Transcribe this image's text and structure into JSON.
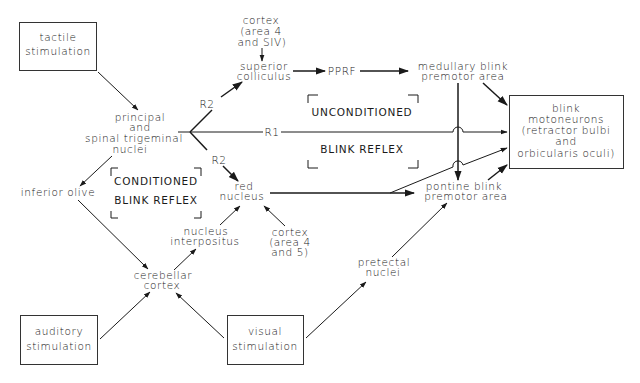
{
  "diagram": {
    "boxes": {
      "tactile": [
        "tactile",
        "stimulation"
      ],
      "auditory": [
        "auditory",
        "stimulation"
      ],
      "visual": [
        "visual",
        "stimulation"
      ],
      "motoneurons": [
        "blink",
        "motoneurons",
        "(retractor bulbi",
        "and",
        "orbicularis oculi)"
      ]
    },
    "nodes": {
      "trigeminal": [
        "principal",
        "and",
        "spinal trigeminal",
        "nuclei"
      ],
      "cortex_top": [
        "cortex",
        "(area 4",
        "and SIV)"
      ],
      "superior_colliculus": [
        "superior",
        "colliculus"
      ],
      "pprf": "PPRF",
      "medullary": [
        "medullary blink",
        "premotor area"
      ],
      "pontine": [
        "pontine blink",
        "premotor area"
      ],
      "red_nucleus": [
        "red",
        "nucleus"
      ],
      "cortex_bottom": [
        "cortex",
        "(area 4",
        "and 5)"
      ],
      "nucleus_interpositus": [
        "nucleus",
        "interpositus"
      ],
      "inferior_olive": "inferior olive",
      "cerebellar_cortex": [
        "cerebellar",
        "cortex"
      ],
      "pretectal": [
        "pretectal",
        "nuclei"
      ]
    },
    "pathway_labels": {
      "r2_up": "R2",
      "r1": "R1",
      "r2_down": "R2"
    },
    "region_labels": {
      "unconditioned": "UNCONDITIONED",
      "unconditioned_sub": "BLINK REFLEX",
      "conditioned": "CONDITIONED",
      "conditioned_sub": "BLINK REFLEX"
    },
    "colors": {
      "ink": "#1a1a1a",
      "background": "#ffffff"
    }
  }
}
